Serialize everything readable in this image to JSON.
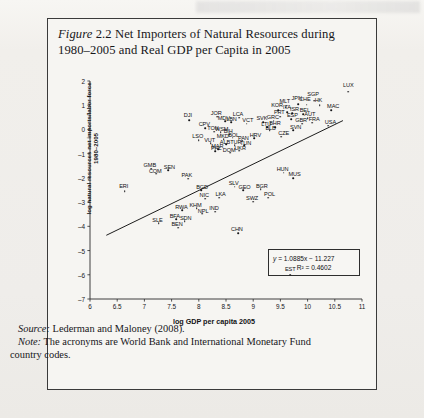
{
  "figure": {
    "label": "Figure",
    "number": "2.2",
    "title_line1": "Net Importers of Natural Resources during",
    "title_line2": "1980–2005 and Real GDP per Capita in 2005"
  },
  "footer": {
    "source_label": "Source:",
    "source_text": "Lederman and Maloney (2008).",
    "note_label": "Note:",
    "note_text": "The acronyms are World Bank and International Monetary Fund country codes."
  },
  "equation": {
    "line1": "y = 1.0885x − 11.227",
    "line2": "R² = 0.4602"
  },
  "chart_data": {
    "type": "scatter",
    "title": "Figure 2.2 Net Importers of Natural Resources during 1980–2005 and Real GDP per Capita in 2005",
    "xlabel": "log GDP per capita 2005",
    "ylabel": "log natural resources net imports/labor force 1980–2005",
    "xlim": [
      6,
      11
    ],
    "ylim": [
      -7,
      2
    ],
    "xticks": [
      "6",
      "6.5",
      "7",
      "7.5",
      "8",
      "8.5",
      "9",
      "9.5",
      "10",
      "10.5",
      "11"
    ],
    "yticks": [
      "2",
      "1",
      "0",
      "–1",
      "–2",
      "–3",
      "–4",
      "–5",
      "–6",
      "–7"
    ],
    "grid": false,
    "legend": null,
    "trendline": {
      "equation": "y = 1.0885x − 11.227",
      "r2": "0.4602",
      "slope": 1.0885,
      "intercept": -11.227,
      "x_start": 6.3,
      "x_end": 10.65
    },
    "points": [
      {
        "code": "LUX",
        "x": 10.75,
        "y": 1.55,
        "lx": 10.75,
        "ly": 1.82
      },
      {
        "code": "SGP",
        "x": 10.12,
        "y": 1.18,
        "lx": 10.1,
        "ly": 1.45
      },
      {
        "code": "HK",
        "x": 10.22,
        "y": 1.0,
        "lx": 10.2,
        "ly": 1.22
      },
      {
        "code": "MAC",
        "x": 10.43,
        "y": 0.8,
        "lx": 10.47,
        "ly": 0.98
      },
      {
        "code": "CHE",
        "x": 9.98,
        "y": 1.02,
        "lx": 9.95,
        "ly": 1.27
      },
      {
        "code": "JPN",
        "x": 9.83,
        "y": 1.05,
        "lx": 9.8,
        "ly": 1.3
      },
      {
        "code": "MLT",
        "x": 9.6,
        "y": 0.92,
        "lx": 9.58,
        "ly": 1.16
      },
      {
        "code": "ITA",
        "x": 9.63,
        "y": 0.72,
        "lx": 9.62,
        "ly": 0.92
      },
      {
        "code": "KOR",
        "x": 9.46,
        "y": 0.8,
        "lx": 9.44,
        "ly": 1.0
      },
      {
        "code": "ISR",
        "x": 9.72,
        "y": 0.68,
        "lx": 9.76,
        "ly": 0.86
      },
      {
        "code": "BEL",
        "x": 9.92,
        "y": 0.62,
        "lx": 9.95,
        "ly": 0.82
      },
      {
        "code": "PRT",
        "x": 9.5,
        "y": 0.52,
        "lx": 9.48,
        "ly": 0.7
      },
      {
        "code": "ESP",
        "x": 9.7,
        "y": 0.42,
        "lx": 9.72,
        "ly": 0.58
      },
      {
        "code": "AUT",
        "x": 10.0,
        "y": 0.46,
        "lx": 10.04,
        "ly": 0.62
      },
      {
        "code": "GRC",
        "x": 9.38,
        "y": 0.36,
        "lx": 9.36,
        "ly": 0.5
      },
      {
        "code": "GBR",
        "x": 9.9,
        "y": 0.24,
        "lx": 9.88,
        "ly": 0.4
      },
      {
        "code": "FRA",
        "x": 10.08,
        "y": 0.28,
        "lx": 10.12,
        "ly": 0.44
      },
      {
        "code": "USA",
        "x": 10.38,
        "y": 0.15,
        "lx": 10.42,
        "ly": 0.3
      },
      {
        "code": "SVN",
        "x": 9.74,
        "y": -0.02,
        "lx": 9.78,
        "ly": 0.12
      },
      {
        "code": "CZE",
        "x": 9.52,
        "y": -0.3,
        "lx": 9.56,
        "ly": -0.16
      },
      {
        "code": "BHR",
        "x": 9.4,
        "y": 0.1,
        "lx": 9.4,
        "ly": 0.26
      },
      {
        "code": "SVK",
        "x": 9.18,
        "y": 0.3,
        "lx": 9.16,
        "ly": 0.46
      },
      {
        "code": "LTU",
        "x": 9.26,
        "y": 0.1,
        "lx": 9.24,
        "ly": 0.24
      },
      {
        "code": "BLB",
        "x": 9.3,
        "y": -0.04,
        "lx": 9.32,
        "ly": 0.08
      },
      {
        "code": "JOR",
        "x": 8.34,
        "y": 0.52,
        "lx": 8.32,
        "ly": 0.68
      },
      {
        "code": "LCA",
        "x": 8.74,
        "y": 0.48,
        "lx": 8.72,
        "ly": 0.64
      },
      {
        "code": "MDV",
        "x": 8.48,
        "y": 0.34,
        "lx": 8.46,
        "ly": 0.48
      },
      {
        "code": "LBN",
        "x": 8.6,
        "y": 0.3,
        "lx": 8.6,
        "ly": 0.42
      },
      {
        "code": "VCT",
        "x": 8.88,
        "y": 0.24,
        "lx": 8.9,
        "ly": 0.38
      },
      {
        "code": "DJI",
        "x": 7.82,
        "y": 0.38,
        "lx": 7.8,
        "ly": 0.58
      },
      {
        "code": "CPV",
        "x": 8.12,
        "y": 0.06,
        "lx": 8.1,
        "ly": 0.22
      },
      {
        "code": "TON",
        "x": 8.28,
        "y": -0.1,
        "lx": 8.26,
        "ly": 0.04
      },
      {
        "code": "WSM",
        "x": 8.4,
        "y": -0.12,
        "lx": 8.42,
        "ly": 0.02
      },
      {
        "code": "BIH",
        "x": 8.56,
        "y": -0.22,
        "lx": 8.54,
        "ly": -0.08
      },
      {
        "code": "MKD",
        "x": 8.46,
        "y": -0.4,
        "lx": 8.44,
        "ly": -0.28
      },
      {
        "code": "BOL",
        "x": 8.62,
        "y": -0.34,
        "lx": 8.64,
        "ly": -0.22
      },
      {
        "code": "HRV",
        "x": 9.02,
        "y": -0.36,
        "lx": 9.04,
        "ly": -0.24
      },
      {
        "code": "PAN",
        "x": 8.8,
        "y": -0.46,
        "lx": 8.82,
        "ly": -0.34
      },
      {
        "code": "LSO",
        "x": 8.0,
        "y": -0.44,
        "lx": 7.98,
        "ly": -0.28
      },
      {
        "code": "VUT",
        "x": 8.22,
        "y": -0.56,
        "lx": 8.2,
        "ly": -0.42
      },
      {
        "code": "ALB",
        "x": 8.5,
        "y": -0.62,
        "lx": 8.48,
        "ly": -0.5
      },
      {
        "code": "TUR",
        "x": 8.66,
        "y": -0.64,
        "lx": 8.68,
        "ly": -0.52
      },
      {
        "code": "TUN",
        "x": 8.84,
        "y": -0.66,
        "lx": 8.86,
        "ly": -0.54
      },
      {
        "code": "MAR",
        "x": 8.36,
        "y": -0.82,
        "lx": 8.34,
        "ly": -0.7
      },
      {
        "code": "PHL",
        "x": 8.3,
        "y": -0.9,
        "lx": 8.32,
        "ly": -0.78
      },
      {
        "code": "UKR",
        "x": 8.74,
        "y": -0.88,
        "lx": 8.76,
        "ly": -0.76
      },
      {
        "code": "DOM",
        "x": 8.58,
        "y": -0.96,
        "lx": 8.56,
        "ly": -0.84
      },
      {
        "code": "GMB",
        "x": 7.12,
        "y": -1.62,
        "lx": 7.1,
        "ly": -1.46
      },
      {
        "code": "COM",
        "x": 7.22,
        "y": -1.82,
        "lx": 7.2,
        "ly": -1.7
      },
      {
        "code": "SEN",
        "x": 7.44,
        "y": -1.68,
        "lx": 7.46,
        "ly": -1.54
      },
      {
        "code": "ERI",
        "x": 6.64,
        "y": -2.56,
        "lx": 6.62,
        "ly": -2.34
      },
      {
        "code": "PAK",
        "x": 7.8,
        "y": -2.04,
        "lx": 7.78,
        "ly": -1.9
      },
      {
        "code": "HUN",
        "x": 9.56,
        "y": -1.78,
        "lx": 9.54,
        "ly": -1.64
      },
      {
        "code": "MUS",
        "x": 9.74,
        "y": -2.02,
        "lx": 9.76,
        "ly": -1.86
      },
      {
        "code": "BGD",
        "x": 8.04,
        "y": -2.52,
        "lx": 8.06,
        "ly": -2.38
      },
      {
        "code": "NIC",
        "x": 8.12,
        "y": -2.86,
        "lx": 8.1,
        "ly": -2.72
      },
      {
        "code": "LKA",
        "x": 8.38,
        "y": -2.82,
        "lx": 8.4,
        "ly": -2.68
      },
      {
        "code": "SLV",
        "x": 8.66,
        "y": -2.36,
        "lx": 8.64,
        "ly": -2.22
      },
      {
        "code": "GEO",
        "x": 8.82,
        "y": -2.5,
        "lx": 8.84,
        "ly": -2.36
      },
      {
        "code": "BGR",
        "x": 9.14,
        "y": -2.46,
        "lx": 9.16,
        "ly": -2.32
      },
      {
        "code": "POL",
        "x": 9.28,
        "y": -2.82,
        "lx": 9.3,
        "ly": -2.68
      },
      {
        "code": "SWZ",
        "x": 9.0,
        "y": -2.98,
        "lx": 8.98,
        "ly": -2.84
      },
      {
        "code": "RWA",
        "x": 7.7,
        "y": -3.34,
        "lx": 7.68,
        "ly": -3.2
      },
      {
        "code": "KHM",
        "x": 7.96,
        "y": -3.26,
        "lx": 7.94,
        "ly": -3.12
      },
      {
        "code": "NPL",
        "x": 8.06,
        "y": -3.48,
        "lx": 8.08,
        "ly": -3.36
      },
      {
        "code": "IND",
        "x": 8.3,
        "y": -3.4,
        "lx": 8.28,
        "ly": -3.24
      },
      {
        "code": "BFA",
        "x": 7.58,
        "y": -3.7,
        "lx": 7.56,
        "ly": -3.56
      },
      {
        "code": "SDN",
        "x": 7.74,
        "y": -3.8,
        "lx": 7.76,
        "ly": -3.66
      },
      {
        "code": "SLE",
        "x": 7.26,
        "y": -3.88,
        "lx": 7.24,
        "ly": -3.74
      },
      {
        "code": "BEN",
        "x": 7.62,
        "y": -4.06,
        "lx": 7.6,
        "ly": -3.92
      },
      {
        "code": "CHN",
        "x": 8.72,
        "y": -4.28,
        "lx": 8.7,
        "ly": -4.1
      },
      {
        "code": "EST",
        "x": 9.68,
        "y": -6.0,
        "lx": 9.68,
        "ly": -5.78
      }
    ]
  }
}
